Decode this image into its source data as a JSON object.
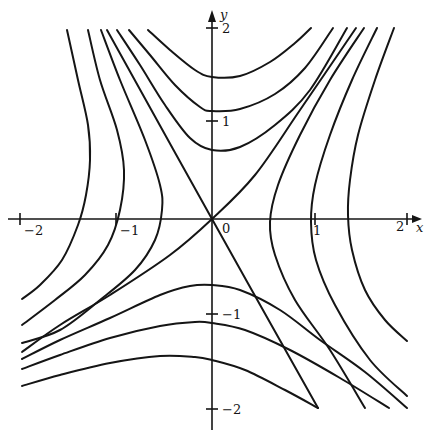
{
  "figure": {
    "stroke_color": "#151515",
    "background": "#ffffff"
  },
  "axes": {
    "x_label": "x",
    "y_label": "y",
    "origin_label": "0",
    "x_ticks": [
      {
        "label": "−2",
        "px": 20
      },
      {
        "label": "−1",
        "px": 116
      },
      {
        "label": "1",
        "px": 315
      },
      {
        "label": "2",
        "px": 407
      }
    ],
    "y_ticks": [
      {
        "label": "2",
        "py": 28
      },
      {
        "label": "1",
        "py": 121
      },
      {
        "label": "−1",
        "py": 314
      },
      {
        "label": "−2",
        "py": 409
      }
    ]
  },
  "chart_data": {
    "type": "line",
    "title": "",
    "xlabel": "x",
    "ylabel": "y",
    "xlim": [
      -2,
      2
    ],
    "ylim": [
      -2,
      2
    ],
    "grid": false,
    "series": [
      {
        "name": "upper-branch-1",
        "vertex": [
          0,
          1.48
        ]
      },
      {
        "name": "upper-branch-2",
        "vertex": [
          0,
          1.12
        ]
      },
      {
        "name": "upper-branch-3",
        "vertex": [
          0,
          0.72
        ]
      },
      {
        "name": "lower-branch-1",
        "vertex": [
          0,
          -0.69
        ]
      },
      {
        "name": "lower-branch-2",
        "vertex": [
          0,
          -1.09
        ]
      },
      {
        "name": "lower-branch-3",
        "vertex": [
          0,
          -1.47
        ]
      },
      {
        "name": "left-branch-1",
        "vertex": [
          -0.52,
          0.2
        ]
      },
      {
        "name": "left-branch-2",
        "vertex": [
          -0.92,
          0.5
        ]
      },
      {
        "name": "left-branch-3",
        "vertex": [
          -1.27,
          0.6
        ]
      },
      {
        "name": "right-branch-1",
        "vertex": [
          0.6,
          0
        ]
      },
      {
        "name": "right-branch-2",
        "vertex": [
          1.02,
          0
        ]
      },
      {
        "name": "right-branch-3",
        "vertex": [
          1.41,
          0.05
        ]
      },
      {
        "name": "asymptote-1",
        "through": [
          [
            0,
            0
          ],
          [
            1,
            -1
          ]
        ]
      },
      {
        "name": "asymptote-2",
        "through": [
          [
            0,
            0
          ],
          [
            1,
            1
          ]
        ]
      }
    ]
  },
  "curves": [
    {
      "name": "upper-curve-1",
      "points": "148,30 170,50 195,70 212,77 240,76 270,62 295,43 311,28"
    },
    {
      "name": "upper-curve-2",
      "points": "129,30 150,55 175,85 200,107 212,111 240,109 275,94 305,68 333,28"
    },
    {
      "name": "upper-curve-3",
      "points": "117,30 140,65 165,105 190,138 212,150 240,147 275,125 310,90 347,28"
    },
    {
      "name": "asymptote-1",
      "points": "107,30 212,219 318,408"
    },
    {
      "name": "asymptote-2",
      "points": "356,28 300,110 255,175 212,219 170,255 110,295 60,325 22,352"
    },
    {
      "name": "right-curve-1",
      "points": "364,28 330,80 300,135 278,185 270,222 275,255 295,300 330,350 365,408"
    },
    {
      "name": "right-curve-2",
      "points": "377,28 352,80 330,135 315,185 311,222 316,260 335,305 370,360 407,396"
    },
    {
      "name": "right-curve-3",
      "points": "394,28 375,80 358,135 350,180 348,215 352,250 365,290 385,320 407,341"
    },
    {
      "name": "left-curve-1",
      "points": "101,30 120,80 145,140 160,185 162,210 155,240 135,270 100,300 60,330 22,343"
    },
    {
      "name": "left-curve-2",
      "points": "88,30 100,80 117,130 124,170 120,210 108,245 85,275 55,300 22,325"
    },
    {
      "name": "left-curve-3",
      "points": "67,30 78,80 88,125 90,160 86,195 78,225 62,260 40,285 22,299"
    },
    {
      "name": "lower-curve-1",
      "points": "22,359 60,340 110,318 160,295 190,286 212,285 240,290 280,310 320,340 365,372 407,408"
    },
    {
      "name": "lower-curve-2",
      "points": "22,369 60,355 110,338 160,326 195,322 212,323 245,330 290,350 340,378 389,408"
    },
    {
      "name": "lower-curve-3",
      "points": "22,386 60,375 110,363 160,356 195,357 212,360 245,370 285,390 318,408"
    }
  ]
}
